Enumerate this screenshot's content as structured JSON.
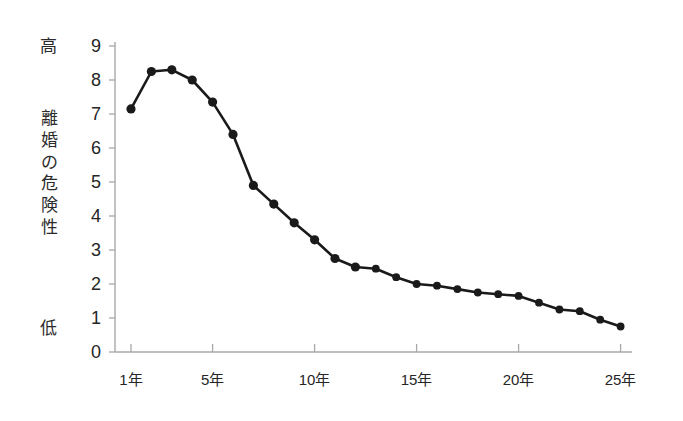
{
  "chart_data": {
    "type": "line",
    "title": "",
    "subtitle": "",
    "xlabel": "",
    "ylabel": "離婚の危険性",
    "ylabel_chars": [
      "離",
      "婚",
      "の",
      "危",
      "険",
      "性"
    ],
    "y_high_label": "高",
    "y_low_label": "低",
    "xlim": [
      0.5,
      25.5
    ],
    "ylim": [
      0,
      9
    ],
    "grid": false,
    "legend": null,
    "legend_position": "none",
    "marker": "filled-circle",
    "line_color": "#1a1a1a",
    "marker_color": "#1a1a1a",
    "axis_color": "#a8a8a8",
    "background_color": "#ffffff",
    "y_ticks": [
      0,
      1,
      2,
      3,
      4,
      5,
      6,
      7,
      8,
      9
    ],
    "y_tick_labels": [
      "0",
      "1",
      "2",
      "3",
      "4",
      "5",
      "6",
      "7",
      "8",
      "9"
    ],
    "x_ticks": [
      1,
      5,
      10,
      15,
      20,
      25
    ],
    "x_tick_labels": [
      "1年",
      "5年",
      "10年",
      "15年",
      "20年",
      "25年"
    ],
    "x": [
      1,
      2,
      3,
      4,
      5,
      6,
      7,
      8,
      9,
      10,
      11,
      12,
      13,
      14,
      15,
      16,
      17,
      18,
      19,
      20,
      21,
      22,
      23,
      24,
      25
    ],
    "values": [
      7.15,
      8.25,
      8.3,
      8.0,
      7.35,
      6.4,
      4.9,
      4.35,
      3.8,
      3.3,
      2.75,
      2.5,
      2.45,
      2.2,
      2.0,
      1.95,
      1.85,
      1.75,
      1.7,
      1.65,
      1.45,
      1.25,
      1.2,
      0.95,
      0.75
    ],
    "annotations": []
  },
  "figure": {
    "geometry": {
      "plot_left_px": 115,
      "plot_right_px": 632,
      "plot_top_px": 42,
      "plot_bottom_px": 352,
      "x_year_one_px": 131,
      "px_per_year": 20.4,
      "y_zero_px": 352,
      "px_per_unit": 34
    }
  }
}
